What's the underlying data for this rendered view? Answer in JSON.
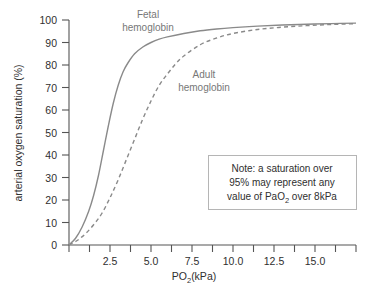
{
  "chart_data": {
    "type": "line",
    "title": "",
    "xlabel": "PO2(kPa)",
    "xlabel_main": "PO",
    "xlabel_sub": "2",
    "xlabel_unit": "(kPa)",
    "ylabel": "arterial oxygen saturation (%)",
    "xlim": [
      0,
      17.5
    ],
    "ylim": [
      0,
      100
    ],
    "grid": false,
    "legend_position": "inline-annotations",
    "x_ticks_major": [
      2.5,
      5.0,
      7.5,
      10.0,
      12.5,
      15.0
    ],
    "x_tick_labels": [
      "2.5",
      "5.0",
      "7.5",
      "10.0",
      "12.5",
      "15.0"
    ],
    "x_ticks_minor": [
      0,
      1.25,
      3.75,
      6.25,
      8.75,
      11.25,
      13.75,
      16.25,
      17.5
    ],
    "y_ticks": [
      0,
      10,
      20,
      30,
      40,
      50,
      60,
      70,
      80,
      90,
      100
    ],
    "y_tick_labels": [
      "0",
      "10",
      "20",
      "30",
      "40",
      "50",
      "60",
      "70",
      "80",
      "90",
      "100"
    ],
    "series": [
      {
        "name": "Fetal hemoglobin",
        "style": "solid",
        "color": "#8a8a8a",
        "x": [
          0.0,
          0.4,
          0.8,
          1.2,
          1.5,
          1.8,
          2.1,
          2.4,
          2.7,
          3.0,
          3.3,
          3.6,
          4.0,
          4.5,
          5.0,
          5.5,
          6.0,
          7.0,
          8.0,
          9.0,
          10.0,
          11.5,
          13.0,
          14.5,
          16.0,
          17.5
        ],
        "y": [
          0,
          3,
          8,
          15,
          22,
          31,
          42,
          53,
          63,
          71,
          77,
          81,
          85,
          88,
          90,
          91.5,
          92.5,
          94,
          95.2,
          96,
          96.6,
          97.3,
          97.8,
          98.1,
          98.4,
          98.6
        ]
      },
      {
        "name": "Adult hemoglobin",
        "style": "dashed",
        "color": "#8a8a8a",
        "x": [
          0.0,
          0.5,
          1.0,
          1.5,
          2.0,
          2.5,
          3.0,
          3.5,
          4.0,
          4.5,
          5.0,
          5.5,
          6.0,
          6.5,
          7.0,
          8.0,
          9.0,
          10.0,
          11.5,
          13.0,
          14.5,
          16.0,
          17.5
        ],
        "y": [
          0,
          2,
          5,
          9,
          14,
          21,
          29,
          38,
          47,
          56,
          64,
          71,
          76,
          80.5,
          84,
          89,
          92,
          94,
          95.8,
          96.8,
          97.5,
          98.0,
          98.4
        ]
      }
    ],
    "annotations": [
      {
        "name": "fetal-hemoglobin-label",
        "line1": "Fetal",
        "line2": "hemoglobin",
        "x_px": 148,
        "y_px": 18
      },
      {
        "name": "adult-hemoglobin-label",
        "line1": "Adult",
        "line2": "hemoglobin",
        "x_px": 204,
        "y_px": 78
      }
    ]
  },
  "note_box": {
    "name": "note-box",
    "line1": "Note: a saturation over",
    "line2": "95% may represent any",
    "line3_pre": "value of PaO",
    "line3_sub": "2",
    "line3_post": " over 8kPa",
    "border_color": "#b5b5b5",
    "background": "#ffffff"
  },
  "colors": {
    "axis": "#555555",
    "curve": "#8a8a8a",
    "text": "#2f2f2f",
    "label_gray": "#777777",
    "background": "#ffffff"
  }
}
